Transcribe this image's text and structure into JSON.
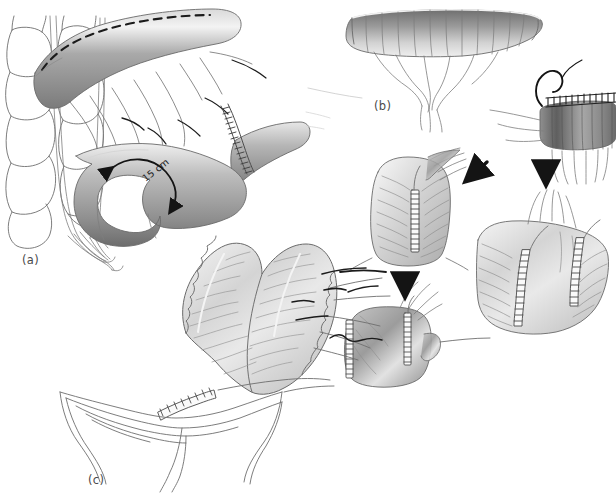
{
  "figure": {
    "background_color": "#ffffff",
    "ink_color": "#5a5a5a",
    "dark_ink_color": "#1b1b1b",
    "shade_light": "#f2f2f2",
    "shade_mid": "#b9b9b9",
    "shade_dark": "#6e6e6e",
    "width": 616,
    "height": 493
  },
  "panels": [
    {
      "id": "a",
      "label": "(a)",
      "label_x": 22,
      "label_y": 253,
      "caption": "Sigmoid colon and rectum with proposed colotomy line and 15 cm mobilized segment",
      "annotations": [
        {
          "name": "measurement",
          "text": "15 cm",
          "x": 140,
          "y": 175,
          "rotation": -38
        }
      ],
      "elements": [
        "haustrated-colon-loops",
        "mesenteric-vessels",
        "shaded-bowel-limb-with-dashed-incision-line",
        "staple-line",
        "curved-double-headed-arrow"
      ]
    },
    {
      "id": "b",
      "label": "(b)",
      "label_x": 374,
      "label_y": 99,
      "caption": "Opened bowel limbs sutured side-to-side to create the pouch",
      "annotations": [],
      "elements": [
        "opened-bowel-flat-segment",
        "suture-needle-with-thread",
        "running-suture-line",
        "bowel-cuff-segment",
        "pouch-front-view",
        "pouch-open-view",
        "completed-pouch",
        "arrow-diagonal-left",
        "arrow-down-center",
        "arrow-down-right"
      ]
    },
    {
      "id": "c",
      "label": "(c)",
      "label_x": 88,
      "label_y": 473,
      "caption": "Completed J-pouch anastomosed to the anal canal",
      "annotations": [],
      "elements": [
        "j-pouch-limbs",
        "anastomosis-staple-line",
        "anal-canal-sphincter",
        "mesenteric-pedicle"
      ]
    }
  ],
  "arrows": [
    {
      "name": "arrow-diagonal-left",
      "x": 470,
      "y": 178,
      "angle": 215
    },
    {
      "name": "arrow-down-center",
      "x": 405,
      "y": 292,
      "angle": 90
    },
    {
      "name": "arrow-down-right",
      "x": 546,
      "y": 178,
      "angle": 90
    }
  ]
}
